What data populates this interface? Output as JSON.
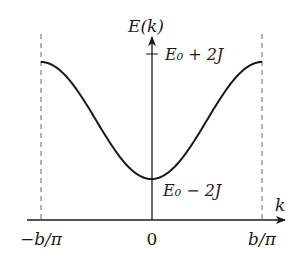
{
  "diagram": {
    "y_axis_label": "E(k)",
    "x_axis_label": "k",
    "upper_level_label": "E₀ + 2J",
    "lower_level_label": "E₀ − 2J",
    "x_ticks": [
      {
        "label": "−b/π",
        "value": -1
      },
      {
        "label": "0",
        "value": 0
      },
      {
        "label": "b/π",
        "value": 1
      }
    ],
    "curve": {
      "function": "E(k) = E0 - 2J cos(pi k b)",
      "domain": [
        -1,
        1
      ],
      "min_label": "E₀ − 2J",
      "max_label": "E₀ + 2J"
    },
    "boundary_lines": [
      "−b/π",
      "b/π"
    ],
    "colors": {
      "ink": "#1a1a1a",
      "dashed": "#666666",
      "background": "#ffffff"
    }
  }
}
